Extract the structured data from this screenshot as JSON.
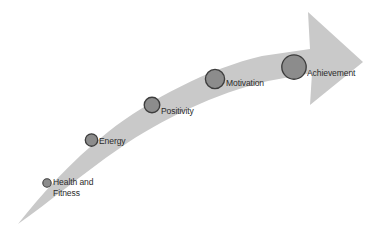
{
  "diagram": {
    "type": "upward-curved-arrow-progression",
    "title": "",
    "arrow": {
      "fill_color": "#c9c9c9",
      "direction": "right-upward",
      "description": "tapered curved arrow sweeping from lower-left to upper-right ending in a chevron arrowhead"
    },
    "marker_style": {
      "fill_color": "#8c8c8c",
      "stroke_color": "#3d3d3d",
      "shape": "circle",
      "note": "circle size increases along the progression"
    },
    "text_color": "#2b2b2b",
    "background_color": "#ffffff",
    "stages": [
      {
        "id": "health-and-fitness",
        "label": "Health and\nFitness",
        "order": 1,
        "circle": {
          "cx": 47,
          "cy": 183,
          "r": 4.2
        },
        "label_x": 53,
        "label_y": 177,
        "multiline": true
      },
      {
        "id": "energy",
        "label": "Energy",
        "order": 2,
        "circle": {
          "cx": 91.5,
          "cy": 140,
          "r": 6.2
        },
        "label_x": 99,
        "label_y": 136,
        "multiline": false
      },
      {
        "id": "positivity",
        "label": "Positivity",
        "order": 3,
        "circle": {
          "cx": 152,
          "cy": 105,
          "r": 7.8
        },
        "label_x": 161,
        "label_y": 106,
        "multiline": false
      },
      {
        "id": "motivation",
        "label": "Motivation",
        "order": 4,
        "circle": {
          "cx": 215,
          "cy": 79,
          "r": 9.6
        },
        "label_x": 226,
        "label_y": 78,
        "multiline": false
      },
      {
        "id": "achievement",
        "label": "Achievement",
        "order": 5,
        "circle": {
          "cx": 294,
          "cy": 67,
          "r": 12.2
        },
        "label_x": 307,
        "label_y": 68,
        "multiline": false
      }
    ]
  }
}
